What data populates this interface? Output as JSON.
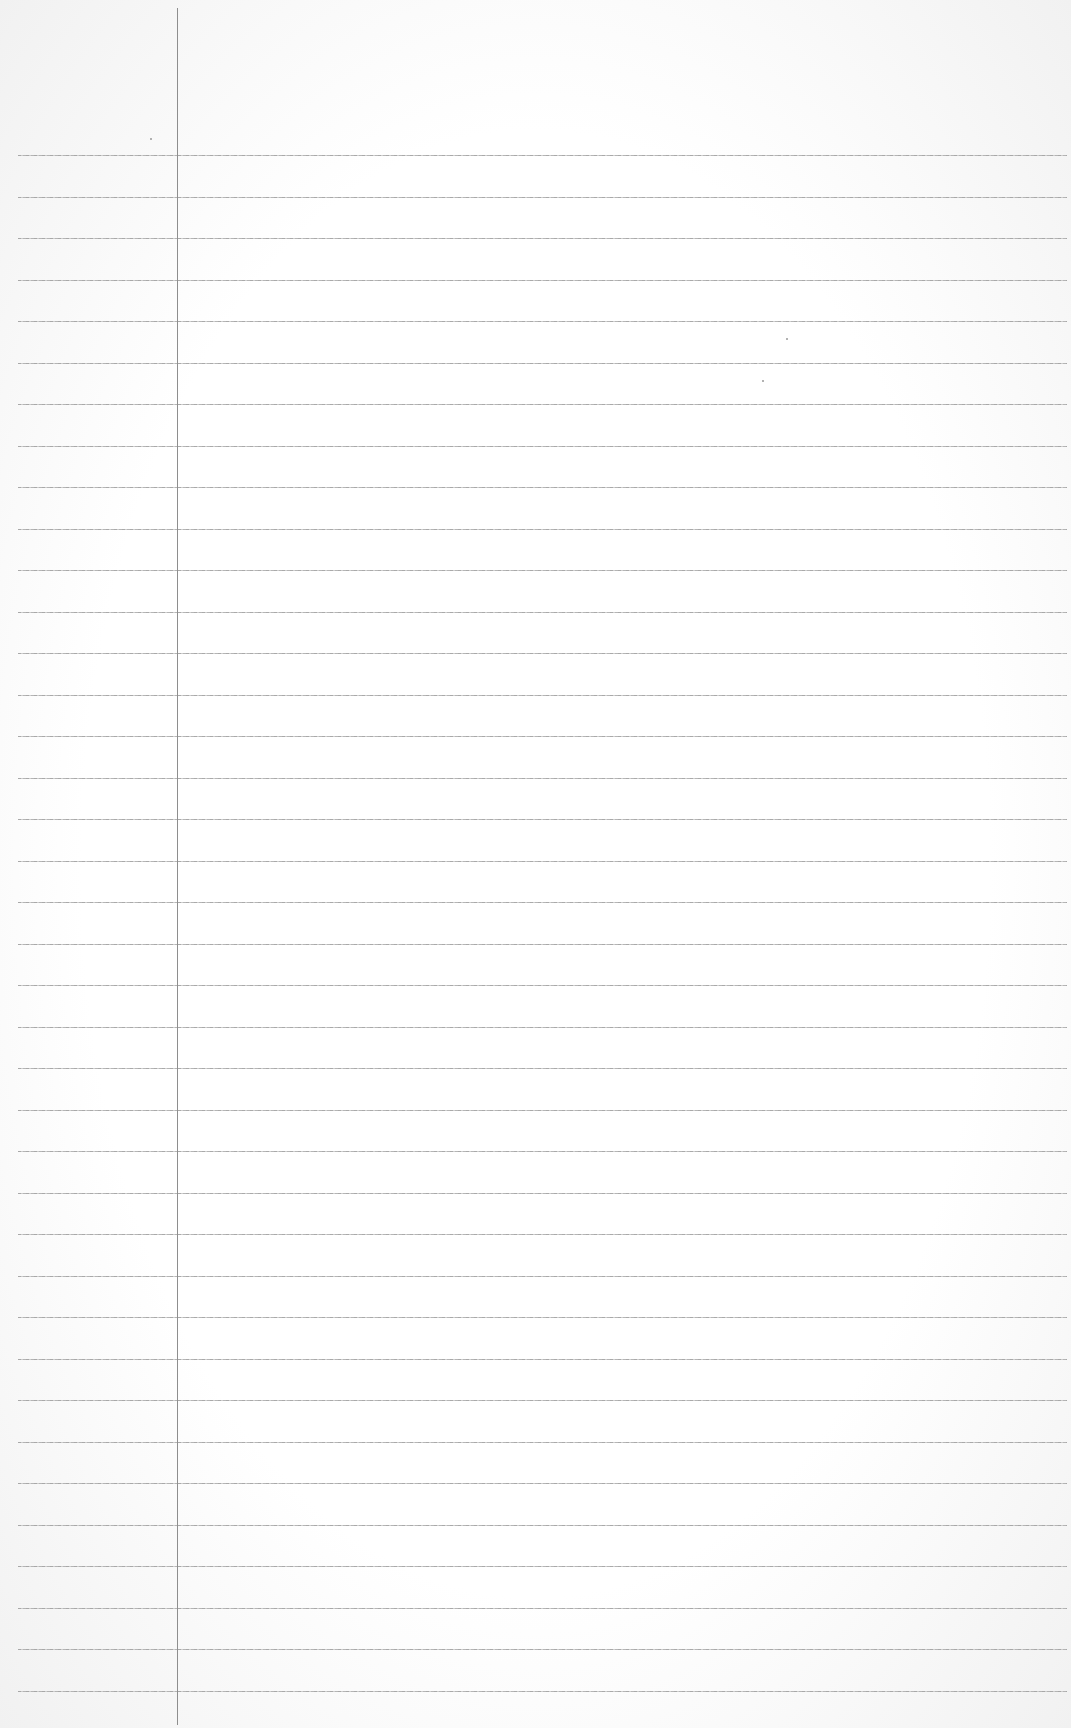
{
  "page": {
    "type": "lined-paper",
    "background_color": "#ffffff",
    "rule_color": "#a0a0a0",
    "margin_line_color": "#8e8e8e",
    "margin_x": 177,
    "first_rule_y": 155,
    "rule_spacing": 41.5,
    "rule_count": 38
  }
}
